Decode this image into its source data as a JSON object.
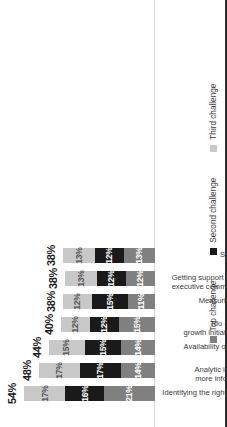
{
  "chart_data": {
    "type": "bar",
    "subtype": "stacked-bar",
    "orientation": "vertical-rotated-90ccw",
    "title": "",
    "xlabel": "",
    "ylabel": "",
    "ylim": [
      0,
      60
    ],
    "grid": false,
    "legend_position": "bottom",
    "value_format": "percent",
    "categories": [
      "Identifying the right areas to invest",
      "Analytic insights to make more informed decisions",
      "Availability of the right talent",
      "Too many concuring growth initiatives to invest in",
      "Measuring the outcome",
      "Getting support from Board and executive committee to reinvest",
      "Sufficient funding"
    ],
    "series": [
      {
        "name": "Top challenge",
        "color": "#808080",
        "values": [
          21,
          14,
          14,
          15,
          11,
          12,
          13
        ],
        "labels": [
          "21%",
          "14%",
          "14%",
          "15%",
          "11%",
          "12%",
          "13%"
        ]
      },
      {
        "name": "Second challenge",
        "color": "#1a1a1a",
        "values": [
          16,
          17,
          15,
          12,
          15,
          12,
          12
        ],
        "labels": [
          "16%",
          "17%",
          "15%",
          "12%",
          "15%",
          "12%",
          "12%"
        ]
      },
      {
        "name": "Third challenge",
        "color": "#c8c8c8",
        "values": [
          17,
          17,
          15,
          12,
          12,
          13,
          13
        ],
        "labels": [
          "17%",
          "17%",
          "15%",
          "12%",
          "12%",
          "13%",
          "13%"
        ]
      }
    ],
    "totals": [
      54,
      48,
      44,
      40,
      38,
      38,
      38
    ],
    "total_labels": [
      "54%",
      "48%",
      "44%",
      "40%",
      "38%",
      "38%",
      "38%"
    ]
  },
  "legend": {
    "items": [
      {
        "label": "Top challenge",
        "color": "#808080"
      },
      {
        "label": "Second challenge",
        "color": "#1a1a1a"
      },
      {
        "label": "Third challenge",
        "color": "#c8c8c8"
      }
    ]
  },
  "category_lines": [
    [
      "Identifying the right areas to invest"
    ],
    [
      "Analytic insights to make",
      "more informed decisions"
    ],
    [
      "Availability of the right talent"
    ],
    [
      "Too many concuring",
      "growth initiatives to invest in"
    ],
    [
      "Measuring the outcome"
    ],
    [
      "Getting support from Board and",
      "executive committee to reinvest"
    ],
    [
      "Sufficient funding"
    ]
  ]
}
